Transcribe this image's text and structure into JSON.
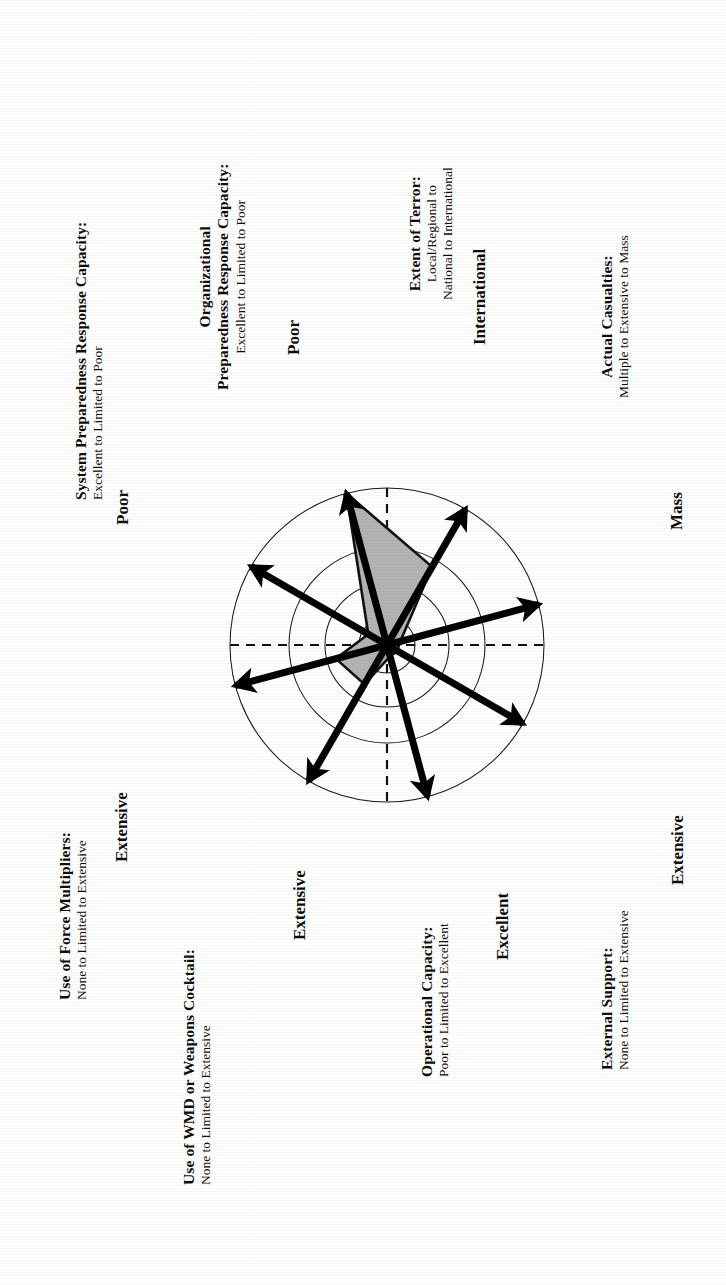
{
  "figure": {
    "type": "radar-diagram",
    "orientation_note": "page content rotated 90 degrees counter-clockwise",
    "background": "#ffffff",
    "fill_color": "#b3b3b3",
    "stroke_color": "#000000"
  },
  "chart_data": {
    "type": "radar",
    "title": "",
    "rings": 4,
    "grid": true,
    "axis_range": [
      0,
      4
    ],
    "center": {
      "x": 387,
      "y": 645
    },
    "outer_radius": 157,
    "ring_radii": [
      28,
      62,
      98,
      157
    ],
    "categories": [
      "Organizational Preparedness Response Capacity",
      "Extent of Terror",
      "Actual Casualties",
      "External Support",
      "Operational Capacity",
      "Use of WMD or Weapons Cocktail",
      "Use of Force Multipliers",
      "System Preparedness Response Capacity"
    ],
    "values": [
      4.0,
      2.3,
      0.35,
      0.3,
      0.3,
      1.15,
      1.35,
      0.55
    ],
    "axes": [
      {
        "index": 0,
        "id": "organizational-preparedness",
        "title_line1": "Organizational",
        "title_line2": "Preparedness Response Capacity:",
        "scale": "Excellent to Limited to Poor",
        "tip_label": "Poor",
        "angle_deg": 90,
        "value": 4.0
      },
      {
        "index": 1,
        "id": "extent-of-terror",
        "title_line1": "Extent of Terror:",
        "title_line2": "",
        "scale_line1": "Local/Regional to",
        "scale_line2": "National to International",
        "scale": "Local/Regional to National to International",
        "tip_label": "International",
        "angle_deg": 45,
        "value": 2.3
      },
      {
        "index": 2,
        "id": "actual-casualties",
        "title_line1": "Actual Casualties:",
        "title_line2": "",
        "scale": "Multiple to Extensive to Mass",
        "tip_label": "Mass",
        "angle_deg": 0,
        "value": 0.35
      },
      {
        "index": 3,
        "id": "external-support",
        "title_line1": "External Support:",
        "title_line2": "",
        "scale": "None to Limited to Extensive",
        "tip_label": "Extensive",
        "angle_deg": -45,
        "value": 0.3
      },
      {
        "index": 4,
        "id": "operational-capacity",
        "title_line1": "Operational Capacity:",
        "title_line2": "",
        "scale": "Poor to Limited to Excellent",
        "tip_label": "Excellent",
        "angle_deg": -90,
        "value": 0.3
      },
      {
        "index": 5,
        "id": "use-of-wmd-or-weapons-cocktail",
        "title_line1": "Use of WMD or Weapons Cocktail:",
        "title_line2": "",
        "scale": "None to Limited to Extensive",
        "tip_label": "Extensive",
        "angle_deg": -135,
        "value": 1.15
      },
      {
        "index": 6,
        "id": "use-of-force-multipliers",
        "title_line1": "Use of Force Multipliers:",
        "title_line2": "",
        "scale": "None to Limited to Extensive",
        "tip_label": "Extensive",
        "angle_deg": 180,
        "value": 1.35
      },
      {
        "index": 7,
        "id": "system-preparedness",
        "title_line1": "System Preparedness Response Capacity:",
        "title_line2": "",
        "scale": "Excellent to Limited to Poor",
        "tip_label": "Poor",
        "angle_deg": 135,
        "value": 0.55
      }
    ],
    "legend": [],
    "annotations": []
  },
  "labels": {
    "system_preparedness": {
      "title": "System Preparedness Response Capacity:",
      "scale": "Excellent to Limited to Poor",
      "tip": "Poor"
    },
    "organizational_preparedness": {
      "title_a": "Organizational",
      "title_b": "Preparedness Response Capacity:",
      "scale": "Excellent to Limited to Poor",
      "tip": "Poor"
    },
    "extent_of_terror": {
      "title": "Extent of Terror:",
      "scale_a": "Local/Regional to",
      "scale_b": "National to International",
      "tip": "International"
    },
    "actual_casualties": {
      "title": "Actual Casualties:",
      "scale": "Multiple to Extensive to Mass",
      "tip": "Mass"
    },
    "use_of_force_multipliers": {
      "title": "Use of Force Multipliers:",
      "scale": "None to Limited to Extensive",
      "tip": "Extensive"
    },
    "use_of_wmd": {
      "title": "Use of WMD or Weapons Cocktail:",
      "scale": "None to Limited to Extensive",
      "tip": "Extensive"
    },
    "operational_capacity": {
      "title": "Operational Capacity:",
      "scale": "Poor to Limited to Excellent",
      "tip": "Excellent"
    },
    "external_support": {
      "title": "External Support:",
      "scale": "None to Limited to Extensive",
      "tip": "Extensive"
    }
  }
}
